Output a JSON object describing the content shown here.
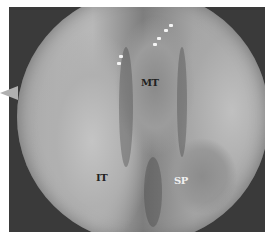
{
  "image": {
    "description": "Endoscopic view of nasal cavity with labeled anatomical structures",
    "labels": [
      {
        "id": "mt",
        "text": "MT",
        "color": "#222222"
      },
      {
        "id": "it",
        "text": "IT",
        "color": "#222222"
      },
      {
        "id": "sp",
        "text": "SP",
        "color": "#f0f0f0"
      }
    ]
  }
}
